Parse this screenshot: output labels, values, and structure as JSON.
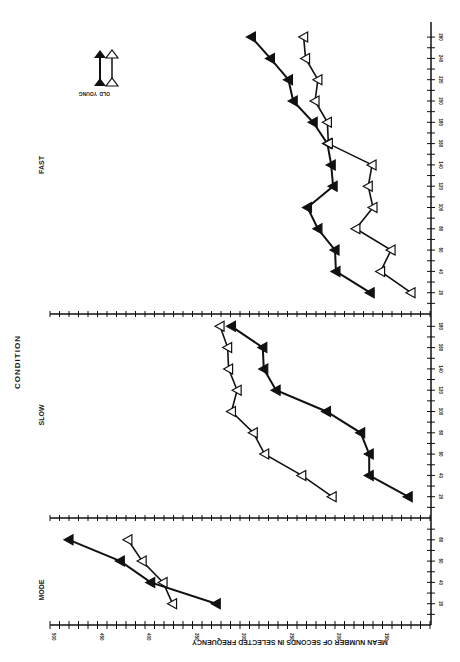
{
  "chart_data": {
    "type": "line",
    "orientation": "rotated-90",
    "title": "CONDITION",
    "xlabel": "",
    "ylabel": "MEAN NUMBER OF SECONDS IN SELECTED FREQUENCY",
    "ylim": [
      100,
      500
    ],
    "yticks": [
      500,
      450,
      400,
      350,
      300,
      250,
      200,
      150
    ],
    "legend": {
      "placement": "top-left",
      "entries": [
        {
          "name": "YOUNG",
          "marker": "filled-triangle"
        },
        {
          "name": "OLD",
          "marker": "open-triangle"
        }
      ]
    },
    "panels": [
      {
        "name": "MODE",
        "xlim": [
          0,
          100
        ],
        "xticks": [
          20,
          40,
          60,
          80
        ],
        "x": [
          20,
          40,
          60,
          80
        ],
        "series": [
          {
            "name": "YOUNG",
            "values": [
              325,
              394,
              426,
              480
            ]
          },
          {
            "name": "OLD",
            "values": [
              371,
              381,
              403,
              418
            ]
          }
        ]
      },
      {
        "name": "SLOW",
        "xlim": [
          0,
          190
        ],
        "xticks": [
          20,
          40,
          60,
          80,
          100,
          120,
          140,
          160,
          180
        ],
        "x": [
          20,
          40,
          60,
          80,
          100,
          120,
          140,
          160,
          180
        ],
        "series": [
          {
            "name": "YOUNG",
            "values": [
              123,
              164,
              164,
              173,
              209,
              262,
              275,
              276,
              309
            ]
          },
          {
            "name": "OLD",
            "values": [
              203,
              235,
              274,
              286,
              309,
              303,
              312,
              313,
              321
            ]
          }
        ]
      },
      {
        "name": "FAST",
        "xlim": [
          0,
          260
        ],
        "xticks": [
          20,
          40,
          60,
          80,
          100,
          120,
          140,
          160,
          180,
          200,
          220,
          240,
          260
        ],
        "x": [
          20,
          40,
          60,
          80,
          100,
          120,
          140,
          160,
          180,
          200,
          220,
          240,
          260
        ],
        "series": [
          {
            "name": "YOUNG",
            "values": [
              163,
              199,
              200,
              218,
              229,
              202,
              204,
              208,
              223,
              244,
              249,
              268,
              288
            ]
          },
          {
            "name": "OLD",
            "values": [
              120,
              152,
              141,
              178,
              160,
              165,
              161,
              207,
              208,
              221,
              218,
              231,
              233
            ]
          }
        ]
      }
    ]
  }
}
